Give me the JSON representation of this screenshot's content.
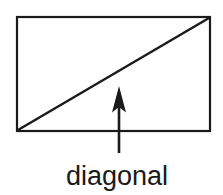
{
  "figure": {
    "label": "diagonal",
    "shapes": [
      "rectangle-shape",
      "diagonal-line",
      "up-arrow-icon"
    ],
    "colors": {
      "line": "#1a1a1a",
      "background": "#ffffff"
    }
  }
}
